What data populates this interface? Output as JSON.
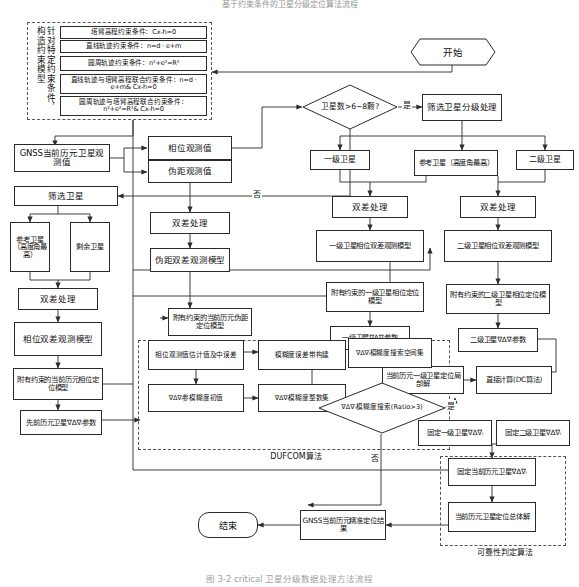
{
  "figure": {
    "top_caption": "基于约束条件的卫星分级定位算法流程",
    "bottom_caption": "图 3-2  critical 卫星分级数据处理方法流程"
  },
  "constraint_group": {
    "vertical_label": "针对特定约束条件，构造约束模型",
    "items": [
      "塔臂高程约束条件：Cx-h=0",
      "直线轨迹约束条件：n=d · e+m",
      "圆周轨迹约束条件：n²+e²=R²",
      "直线轨迹与塔臂高程联合约束条件：n=d · e+m& Cx-h=0",
      "圆周轨迹与塔臂高程联合约束条件：n²+e²=R²& Cx-h=0"
    ]
  },
  "terminators": {
    "start": "开始",
    "end": "结束"
  },
  "decisions": {
    "sat_count": "卫星数>6~8颗?",
    "ambiguity_search": "∇Δ∇ᵢ模糊度搜索(Ratio>3)"
  },
  "edge_labels": {
    "yes1": "是",
    "no1": "否",
    "yes2": "是",
    "no2": "否"
  },
  "nodes": {
    "gnss_obs": "GNSS当前历元卫星观测值",
    "phase_obs": "相位观测值",
    "pseudo_obs": "伪距观测值",
    "filter_sat": "筛选卫星",
    "ref_sat_left": "参考卫星（高度角最高）",
    "rest_sat": "剩余卫星",
    "dd_left": "双差处理",
    "phase_dd_model_left": "相位双差观测模型",
    "constrained_phase_pos_left": "附有约束的当前历元相位定位模型",
    "prev_epoch_params": "先前历元卫星∇Δ∇ᵢ参数",
    "dd_center": "双差处理",
    "pseudo_dd_model": "伪距双差观测模型",
    "constrained_pseudo_pos": "附有约束的当前历元伪距定位模型",
    "sat_filter_grade": "筛选卫星分级处理",
    "first_grade_sat": "一级卫星",
    "ref_sat_right": "参考卫星（高度角最高）",
    "second_grade_sat": "二级卫星",
    "dd_grade1": "双差处理",
    "dd_grade2": "双差处理",
    "phase_dd_model_g1": "一级卫星相位双差观测模型",
    "phase_dd_model_g2": "二级卫星相位双差观测模型",
    "constrained_g1": "附有约束的一级卫星相位定位模型",
    "constrained_g2": "附有约束的二级卫星相位定位模型",
    "g1_params": "一级卫星∇Δ∇ᵢ参数",
    "g2_params": "二级卫星∇Δ∇ᵢ参数",
    "local_solution_g1": "当前历元一级卫星定位局部解",
    "direct_calc": "直接计算(DC算法)",
    "fix_g1": "固定一级卫星∇Δ∇ᵢ",
    "fix_g2": "固定二级卫星∇Δ∇ᵢ",
    "fix_current_epoch": "固定当前历元卫星∇Δ∇ᵢ",
    "overall_solution": "当前历元卫星定位总体解",
    "gnss_result": "GNSS当前历元精准定位结果"
  },
  "dufcom": {
    "label": "DUFCOM算法",
    "phase_est": "相位观测值估计值及中误差",
    "amb_band": "模糊度误差带构建",
    "search_space": "∇Δ∇ᵢ模糊度搜索空间集",
    "amb_init": "∇Δ∇ᵢ参模糊度初值",
    "amb_intset": "∇Δ∇ᵢ模糊度整数集"
  },
  "reliability": {
    "label": "可靠性判定算法"
  },
  "colors": {
    "line": "#2b2b2b",
    "dash": "#555555",
    "background": "#ffffff"
  }
}
